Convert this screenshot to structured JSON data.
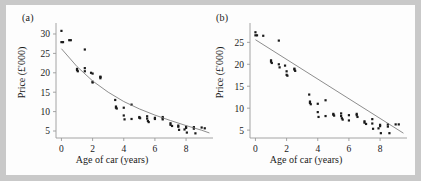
{
  "figure": {
    "background_color": "#c9c9c9",
    "panel_color": "#fdfdfd",
    "point_color": "#1a1a1a",
    "fit_line_color": "#808080",
    "axis_color": "#9a9a9a"
  },
  "panels": {
    "a": {
      "label": "(a)",
      "xlabel": "Age of car (years)",
      "ylabel": "Price (£'000)",
      "xticks": [
        "0",
        "2",
        "4",
        "6",
        "8"
      ],
      "yticks": [
        "5",
        "10",
        "15",
        "20",
        "25",
        "30"
      ]
    },
    "b": {
      "label": "(b)",
      "xlabel": "Age of car (years)",
      "ylabel": "Price (£'000)",
      "xticks": [
        "0",
        "2",
        "4",
        "6",
        "8"
      ],
      "yticks": [
        "5",
        "10",
        "15",
        "20",
        "25"
      ]
    }
  },
  "chart_data": [
    {
      "id": "panel-a",
      "type": "scatter",
      "title": "(a)",
      "xlabel": "Age of car (years)",
      "ylabel": "Price (£'000)",
      "xlim": [
        -0.35,
        9.6
      ],
      "ylim": [
        3.2,
        31.8
      ],
      "xticks": [
        0,
        2,
        4,
        6,
        8
      ],
      "yticks": [
        5,
        10,
        15,
        20,
        25,
        30
      ],
      "grid": false,
      "legend": "none",
      "series": [
        {
          "name": "Observed prices",
          "marker": "square",
          "x": [
            0.0,
            0.0,
            0.1,
            0.5,
            0.6,
            1.0,
            1.0,
            1.05,
            1.5,
            1.5,
            1.5,
            1.9,
            2.0,
            2.0,
            2.0,
            2.5,
            2.5,
            2.5,
            3.45,
            3.5,
            3.5,
            3.55,
            4.0,
            4.0,
            4.05,
            4.5,
            4.5,
            5.0,
            5.0,
            5.05,
            5.5,
            5.5,
            5.55,
            5.6,
            6.0,
            6.0,
            6.5,
            6.5,
            6.5,
            7.0,
            7.0,
            7.1,
            7.5,
            7.5,
            7.55,
            7.9,
            8.0,
            8.0,
            8.05,
            8.5,
            8.5,
            8.6,
            9.0,
            9.2
          ],
          "y": [
            30.8,
            27.9,
            27.9,
            28.4,
            28.4,
            21.0,
            20.7,
            20.4,
            26.0,
            21.2,
            20.4,
            20.0,
            19.8,
            17.7,
            17.5,
            19.0,
            18.9,
            18.6,
            13.0,
            11.3,
            11.0,
            10.8,
            11.0,
            9.0,
            8.0,
            11.8,
            8.1,
            8.6,
            8.4,
            8.3,
            8.8,
            8.2,
            7.6,
            7.3,
            8.4,
            8.1,
            8.6,
            8.3,
            8.0,
            7.0,
            6.6,
            6.3,
            6.4,
            6.1,
            5.3,
            5.4,
            6.1,
            5.8,
            4.6,
            6.0,
            5.6,
            4.4,
            5.9,
            5.7
          ]
        },
        {
          "name": "Fitted exponential decay curve",
          "type": "line",
          "color": "#808080",
          "fit": "exponential",
          "x": [
            0.0,
            1.0,
            2.0,
            3.0,
            4.0,
            5.0,
            6.0,
            7.0,
            8.0,
            9.0,
            9.5
          ],
          "y": [
            26.2,
            21.6,
            17.9,
            15.0,
            12.6,
            10.7,
            9.1,
            7.7,
            6.4,
            5.2,
            4.5
          ]
        }
      ]
    },
    {
      "id": "panel-b",
      "type": "scatter",
      "title": "(b)",
      "xlabel": "Age of car (years)",
      "ylabel": "Price (£'000)",
      "xlim": [
        -0.35,
        9.6
      ],
      "ylim": [
        3.2,
        28.5
      ],
      "xticks": [
        0,
        2,
        4,
        6,
        8
      ],
      "yticks": [
        5,
        10,
        15,
        20,
        25
      ],
      "grid": false,
      "legend": "none",
      "series": [
        {
          "name": "Observed prices",
          "marker": "square",
          "x": [
            0.0,
            0.0,
            0.1,
            0.5,
            1.0,
            1.0,
            1.05,
            1.5,
            1.5,
            1.55,
            1.9,
            2.0,
            2.0,
            2.05,
            2.5,
            2.5,
            2.55,
            3.45,
            3.5,
            3.5,
            3.55,
            4.0,
            4.0,
            4.05,
            4.5,
            4.5,
            5.0,
            5.0,
            5.05,
            5.5,
            5.5,
            5.55,
            5.6,
            6.0,
            6.0,
            6.5,
            6.5,
            6.55,
            7.0,
            7.0,
            7.1,
            7.5,
            7.5,
            7.55,
            7.9,
            8.0,
            8.0,
            8.05,
            8.5,
            8.5,
            8.6,
            9.0,
            9.2
          ],
          "y": [
            27.3,
            26.6,
            26.6,
            26.5,
            20.9,
            20.6,
            20.3,
            25.4,
            20.0,
            19.3,
            19.7,
            18.4,
            17.6,
            17.4,
            19.0,
            18.8,
            18.5,
            13.1,
            11.5,
            11.2,
            10.9,
            11.0,
            9.1,
            8.0,
            11.8,
            8.2,
            8.7,
            8.5,
            8.3,
            8.8,
            8.2,
            7.7,
            7.4,
            8.4,
            7.2,
            8.7,
            8.4,
            8.0,
            7.0,
            6.7,
            6.4,
            7.5,
            6.5,
            5.3,
            5.4,
            6.2,
            5.9,
            4.3,
            6.3,
            5.8,
            4.3,
            6.3,
            6.3
          ]
        },
        {
          "name": "Fitted linear regression line",
          "type": "line",
          "color": "#808080",
          "fit": "linear",
          "x": [
            0.0,
            9.5
          ],
          "y": [
            25.6,
            4.3
          ]
        }
      ]
    }
  ]
}
